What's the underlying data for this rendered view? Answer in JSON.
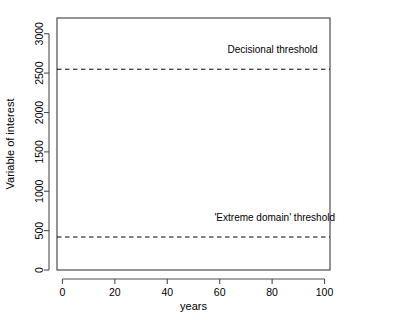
{
  "chart_data": {
    "type": "line",
    "title": "",
    "subtitle": "",
    "xlabel": "years",
    "ylabel": "Variable of interest",
    "xlim": [
      0,
      100
    ],
    "ylim": [
      0,
      3200
    ],
    "xticks": [
      0,
      20,
      40,
      60,
      80,
      100
    ],
    "xticklabels": [
      "0",
      "20",
      "40",
      "60",
      "80",
      "100"
    ],
    "yticks": [
      0,
      500,
      1000,
      1500,
      2000,
      2500,
      3000
    ],
    "yticklabels": [
      "0",
      "500",
      "1000",
      "1500",
      "2000",
      "2500",
      "3000"
    ],
    "grid": false,
    "legend": null,
    "baseline_mean": 215,
    "baseline_noise_amplitude": 42,
    "series": [
      {
        "name": "Variable of interest",
        "color": "#000000",
        "description": "Dense noisy baseline time series with occasional extreme spikes",
        "spikes": [
          {
            "x": 6.6,
            "y": 1700
          },
          {
            "x": 9.5,
            "y": 1090
          },
          {
            "x": 12.8,
            "y": 640
          },
          {
            "x": 14.6,
            "y": 1490
          },
          {
            "x": 17.0,
            "y": 500
          },
          {
            "x": 22.3,
            "y": 470
          },
          {
            "x": 33.8,
            "y": 890
          },
          {
            "x": 38.4,
            "y": 745
          },
          {
            "x": 42.5,
            "y": 470
          },
          {
            "x": 45.6,
            "y": 1900
          },
          {
            "x": 49.8,
            "y": 1400
          },
          {
            "x": 51.0,
            "y": 1450
          },
          {
            "x": 53.8,
            "y": 3050
          },
          {
            "x": 56.6,
            "y": 700
          },
          {
            "x": 58.4,
            "y": 1250
          },
          {
            "x": 60.1,
            "y": 1700
          },
          {
            "x": 61.9,
            "y": 1020
          },
          {
            "x": 63.6,
            "y": 1350
          },
          {
            "x": 66.0,
            "y": 680
          },
          {
            "x": 67.6,
            "y": 1200
          },
          {
            "x": 69.7,
            "y": 2080
          },
          {
            "x": 71.4,
            "y": 1130
          },
          {
            "x": 73.1,
            "y": 1000
          },
          {
            "x": 75.1,
            "y": 630
          },
          {
            "x": 83.2,
            "y": 1340
          },
          {
            "x": 91.0,
            "y": 540
          }
        ]
      }
    ],
    "thresholds": [
      {
        "name": "decisional-threshold",
        "label": "Decisional threshold",
        "value": 2550,
        "style": "dashed",
        "color": "#000000",
        "label_x": 63,
        "label_y": 2750
      },
      {
        "name": "extreme-domain-threshold",
        "label": "'Extreme domain' threshold",
        "value": 420,
        "style": "dashed",
        "color": "#000000",
        "label_x": 58,
        "label_y": 620
      }
    ]
  }
}
